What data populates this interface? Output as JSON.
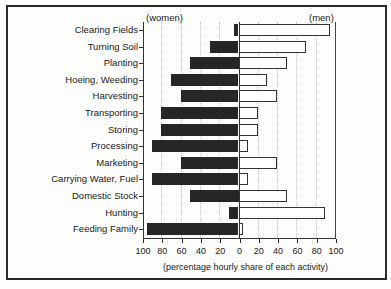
{
  "chart_data": {
    "type": "bar",
    "orientation": "horizontal-diverging",
    "title": "",
    "xlabel": "(percentage hourly share of each activity)",
    "left_label": "(women)",
    "right_label": "(men)",
    "xlim": [
      -100,
      100
    ],
    "x_ticks": [
      "100",
      "80",
      "60",
      "40",
      "20",
      "0",
      "20",
      "40",
      "60",
      "80",
      "100"
    ],
    "grid": true,
    "categories": [
      "Clearing Fields",
      "Turning Soil",
      "Planting",
      "Hoeing, Weeding",
      "Harvesting",
      "Transporting",
      "Storing",
      "Processing",
      "Marketing",
      "Carrying Water, Fuel",
      "Domestic Stock",
      "Hunting",
      "Feeding Family"
    ],
    "series": [
      {
        "name": "women",
        "color": "#262626",
        "values": [
          5,
          30,
          50,
          70,
          60,
          80,
          80,
          90,
          60,
          90,
          50,
          10,
          95
        ]
      },
      {
        "name": "men",
        "color": "#ffffff",
        "values": [
          95,
          70,
          50,
          30,
          40,
          20,
          20,
          10,
          40,
          10,
          50,
          90,
          5
        ]
      }
    ]
  }
}
